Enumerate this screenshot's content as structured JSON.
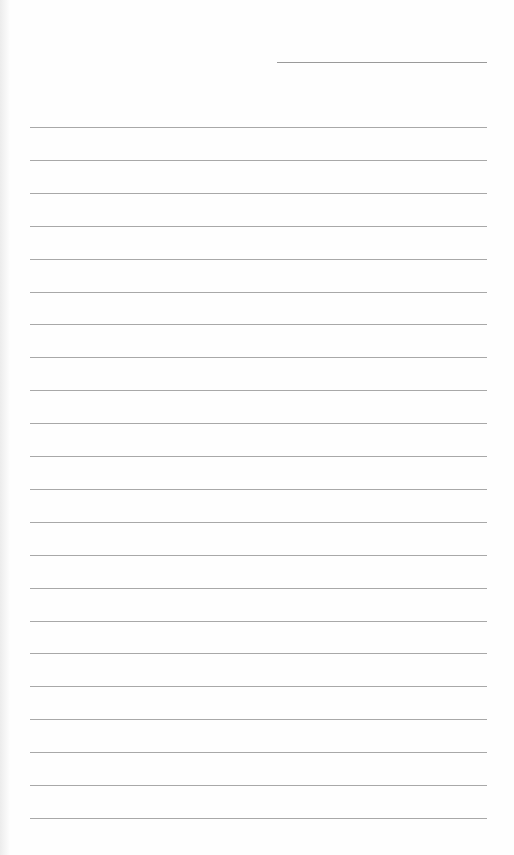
{
  "page": {
    "type": "blank ruled notebook page",
    "background_color": "#fefefe",
    "line_color": "#a8a8a8"
  },
  "header_line": {
    "top": 62,
    "left": 277,
    "width": 210
  },
  "ruled_lines": {
    "count": 22,
    "first_top": 127,
    "spacing": 32.9,
    "left": 30,
    "width": 457
  }
}
